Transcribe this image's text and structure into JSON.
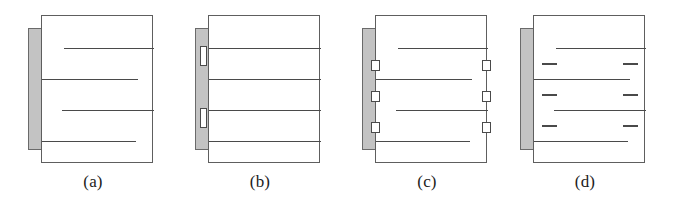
{
  "figure": {
    "background_color": "#ffffff",
    "slab_color": "#c3c3c3",
    "line_color": "#4a4a4a",
    "block_color": "#ffffff",
    "panel_count": 4
  },
  "panels": [
    {
      "id": "panel-a",
      "caption": "(a)",
      "left": 8,
      "lines": [
        {
          "left": 22,
          "right": 0,
          "top": 32
        },
        {
          "left": 0,
          "right": 16,
          "top": 63
        },
        {
          "left": 20,
          "right": 0,
          "top": 94
        },
        {
          "left": 0,
          "right": 18,
          "top": 125
        }
      ],
      "notches_left": [],
      "notches_right": [],
      "squares_left": [],
      "squares_right": [],
      "dashes_left": [],
      "dashes_right": []
    },
    {
      "id": "panel-b",
      "caption": "(b)",
      "left": 175,
      "lines": [
        {
          "left": 0,
          "right": 0,
          "top": 32
        },
        {
          "left": 0,
          "right": 0,
          "top": 63
        },
        {
          "left": 0,
          "right": 0,
          "top": 94
        },
        {
          "left": 0,
          "right": 0,
          "top": 125
        }
      ],
      "notches_left": [
        {
          "top": 18
        },
        {
          "top": 80
        }
      ],
      "notches_right": [
        {
          "top": 49
        },
        {
          "top": 111
        }
      ],
      "squares_left": [],
      "squares_right": [],
      "dashes_left": [],
      "dashes_right": []
    },
    {
      "id": "panel-c",
      "caption": "(c)",
      "left": 342,
      "lines": [
        {
          "left": 22,
          "right": 0,
          "top": 32
        },
        {
          "left": 0,
          "right": 16,
          "top": 63
        },
        {
          "left": 20,
          "right": 0,
          "top": 94
        },
        {
          "left": 0,
          "right": 18,
          "top": 125
        }
      ],
      "notches_left": [],
      "notches_right": [],
      "squares_left": [
        {
          "top": 45
        },
        {
          "top": 76
        },
        {
          "top": 107
        }
      ],
      "squares_right": [
        {
          "top": 45
        },
        {
          "top": 76
        },
        {
          "top": 107
        }
      ],
      "dashes_left": [],
      "dashes_right": []
    },
    {
      "id": "panel-d",
      "caption": "(d)",
      "left": 500,
      "lines": [
        {
          "left": 22,
          "right": 0,
          "top": 32
        },
        {
          "left": 0,
          "right": 16,
          "top": 63
        },
        {
          "left": 20,
          "right": 0,
          "top": 94
        },
        {
          "left": 0,
          "right": 18,
          "top": 125
        }
      ],
      "notches_left": [],
      "notches_right": [],
      "squares_left": [],
      "squares_right": [],
      "dashes_left": [
        {
          "top": 47
        },
        {
          "top": 78
        },
        {
          "top": 109
        }
      ],
      "dashes_right": [
        {
          "top": 47
        },
        {
          "top": 78
        },
        {
          "top": 109
        }
      ]
    }
  ]
}
